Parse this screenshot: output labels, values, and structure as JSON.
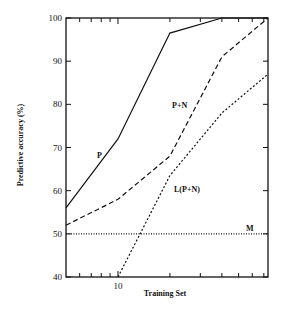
{
  "chart_data": {
    "type": "line",
    "title": "",
    "xlabel": "Training Set",
    "ylabel": "Predictive accuracy (%)",
    "xscale": "log",
    "xlim": [
      5,
      74
    ],
    "ylim": [
      40,
      100
    ],
    "xticks_labeled": [
      10
    ],
    "xtick_minor": [
      5,
      6,
      7,
      8,
      9,
      10,
      20,
      30,
      40,
      50,
      60,
      70
    ],
    "yticks": [
      40,
      50,
      60,
      70,
      80,
      90,
      100
    ],
    "grid": false,
    "legend": "inline labels",
    "series": [
      {
        "name": "P",
        "style": "solid",
        "x": [
          5,
          10,
          20,
          40,
          74
        ],
        "y": [
          56,
          72,
          96.5,
          100,
          100
        ],
        "label_pos": [
          97,
          158
        ]
      },
      {
        "name": "P+N",
        "style": "dashed",
        "x": [
          5,
          10,
          20,
          40,
          74
        ],
        "y": [
          52,
          58,
          68,
          91,
          100
        ],
        "label_pos": [
          172,
          108
        ]
      },
      {
        "name": "L(P+N)",
        "style": "dotted",
        "x": [
          10,
          20,
          40,
          74
        ],
        "y": [
          40,
          63.5,
          78,
          87
        ],
        "label_pos": [
          174,
          192
        ]
      },
      {
        "name": "M",
        "style": "dotted-fine",
        "x": [
          5,
          74
        ],
        "y": [
          50,
          50
        ],
        "label_pos": [
          246,
          231
        ]
      }
    ]
  }
}
